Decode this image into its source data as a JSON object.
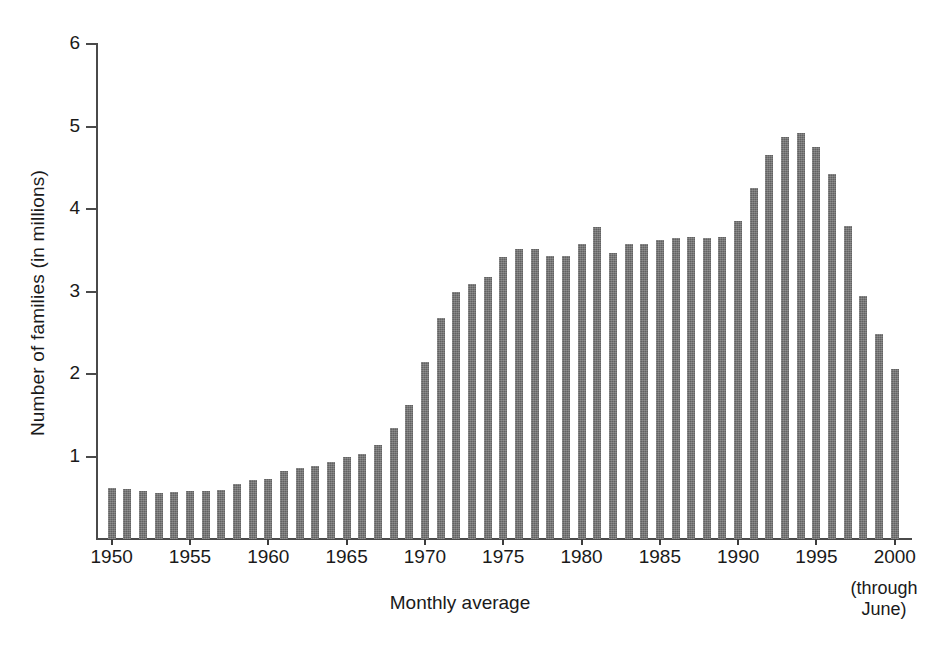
{
  "chart_data": {
    "type": "bar",
    "title": "",
    "subtitle": "",
    "xlabel": "Monthly average",
    "ylabel": "Number of families (in millions)",
    "xlim": [
      1949.4,
      2000.6
    ],
    "ylim": [
      0,
      6
    ],
    "grid": false,
    "legend": null,
    "y_ticks": [
      1,
      2,
      3,
      4,
      5,
      6
    ],
    "y_tick_labels": [
      "1",
      "2",
      "3",
      "4",
      "5",
      "6"
    ],
    "x_ticks": [
      1950,
      1955,
      1960,
      1965,
      1970,
      1975,
      1980,
      1985,
      1990,
      1995,
      2000
    ],
    "x_tick_labels": [
      "1950",
      "1955",
      "1960",
      "1965",
      "1970",
      "1975",
      "1980",
      "1985",
      "1990",
      "1995",
      "2000"
    ],
    "annotations": [
      {
        "text_lines": [
          "(through",
          "June)"
        ],
        "anchor_x": 2000,
        "position": "below-last-tick"
      }
    ],
    "bar_color": "#6e6e6e",
    "axis_color": "#4a4a4a",
    "background_color": "#ffffff",
    "categories": [
      "1950",
      "1951",
      "1952",
      "1953",
      "1954",
      "1955",
      "1956",
      "1957",
      "1958",
      "1959",
      "1960",
      "1961",
      "1962",
      "1963",
      "1964",
      "1965",
      "1966",
      "1967",
      "1968",
      "1969",
      "1970",
      "1971",
      "1972",
      "1973",
      "1974",
      "1975",
      "1976",
      "1977",
      "1978",
      "1979",
      "1980",
      "1981",
      "1982",
      "1983",
      "1984",
      "1985",
      "1986",
      "1987",
      "1988",
      "1989",
      "1990",
      "1991",
      "1992",
      "1993",
      "1994",
      "1995",
      "1996",
      "1997",
      "1998",
      "1999",
      "2000"
    ],
    "values": [
      0.62,
      0.61,
      0.58,
      0.56,
      0.57,
      0.58,
      0.58,
      0.6,
      0.67,
      0.71,
      0.73,
      0.82,
      0.86,
      0.88,
      0.93,
      0.99,
      1.03,
      1.14,
      1.34,
      1.62,
      2.15,
      2.68,
      2.99,
      3.09,
      3.17,
      3.42,
      3.51,
      3.51,
      3.43,
      3.43,
      3.57,
      3.78,
      3.47,
      3.57,
      3.57,
      3.62,
      3.65,
      3.66,
      3.65,
      3.66,
      3.86,
      4.25,
      4.65,
      4.87,
      4.92,
      4.75,
      4.42,
      3.8,
      2.94,
      2.49,
      2.06
    ]
  },
  "axis": {
    "y_title": "Number of families (in millions)",
    "x_title": "Monthly average",
    "note_line1": "(through",
    "note_line2": "June)"
  }
}
